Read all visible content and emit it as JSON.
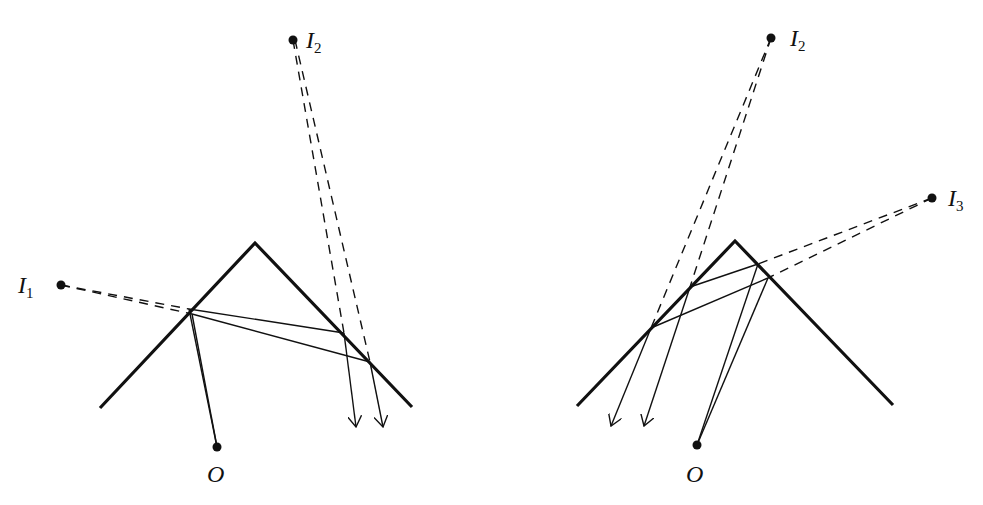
{
  "figure": {
    "colors": {
      "ink": "#111111",
      "background": "#ffffff"
    },
    "left_panel": {
      "labels": {
        "image_1": {
          "base": "I",
          "sub": "1"
        },
        "image_2": {
          "base": "I",
          "sub": "2"
        },
        "observer": "O"
      },
      "mirrors": {
        "apex": [
          255,
          243
        ],
        "left_end": [
          100,
          408
        ],
        "right_end": [
          412,
          407
        ]
      },
      "points": {
        "I1": [
          61,
          285
        ],
        "I2": [
          293,
          40
        ],
        "O": [
          217,
          447
        ]
      },
      "reflections": {
        "left_face": [
          [
            189,
            309
          ],
          [
            192,
            314
          ]
        ],
        "right_face": [
          [
            344,
            333
          ],
          [
            370,
            362
          ]
        ]
      },
      "arrow_tips": [
        [
          356,
          427
        ],
        [
          383,
          427
        ]
      ]
    },
    "right_panel": {
      "labels": {
        "image_2": {
          "base": "I",
          "sub": "2"
        },
        "image_3": {
          "base": "I",
          "sub": "3"
        },
        "observer": "O"
      },
      "mirrors": {
        "apex": [
          735,
          241
        ],
        "left_end": [
          577,
          406
        ],
        "right_end": [
          893,
          405
        ]
      },
      "points": {
        "I2": [
          771,
          38
        ],
        "I3": [
          932,
          198
        ],
        "O": [
          697,
          445
        ]
      },
      "reflections": {
        "left_face": [
          [
            690,
            287
          ],
          [
            651,
            328
          ]
        ],
        "right_face": [
          [
            758,
            264
          ],
          [
            768,
            278
          ]
        ]
      },
      "arrow_tips": [
        [
          611,
          426
        ],
        [
          644,
          426
        ]
      ]
    }
  }
}
